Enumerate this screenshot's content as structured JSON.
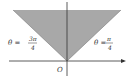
{
  "diagram": {
    "type": "polar-region",
    "region_fill": "#a8a8a8",
    "axis_color": "#333333",
    "labels": {
      "left_ray": {
        "lhs": "θ =",
        "num": "3π",
        "den": "4"
      },
      "right_ray": {
        "lhs": "θ =",
        "num": "π",
        "den": "4"
      },
      "origin": "O"
    }
  }
}
